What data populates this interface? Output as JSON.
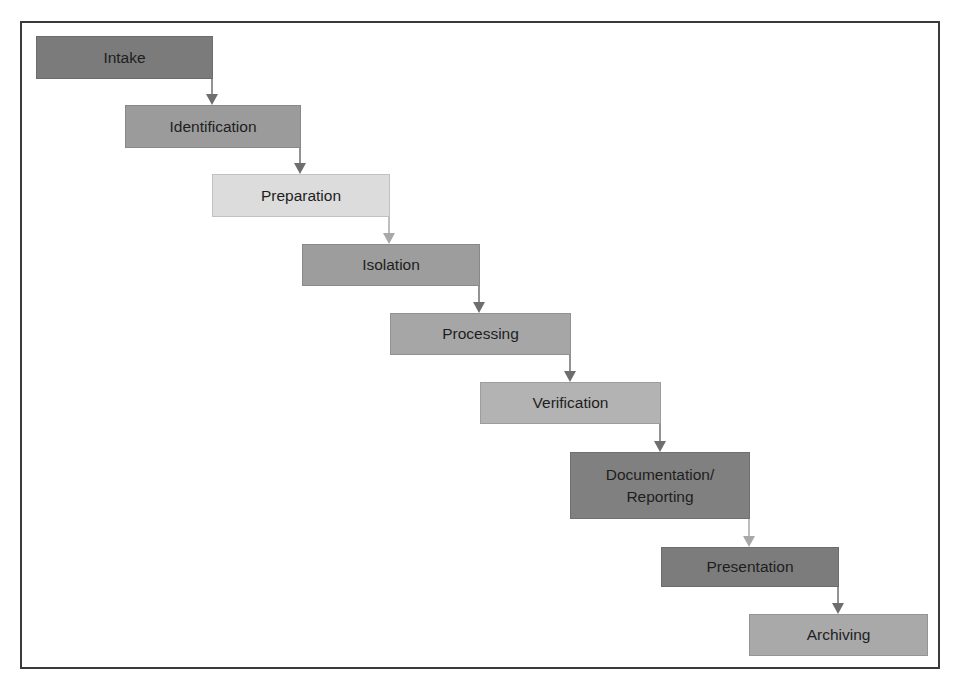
{
  "diagram": {
    "type": "waterfall-process-flow",
    "steps": [
      {
        "label": "Intake",
        "color": "#7b7b7b",
        "x": 36,
        "y": 36,
        "w": 177,
        "h": 43
      },
      {
        "label": "Identification",
        "color": "#9b9b9b",
        "x": 125,
        "y": 105,
        "w": 176,
        "h": 43
      },
      {
        "label": "Preparation",
        "color": "#dcdcdc",
        "x": 212,
        "y": 174,
        "w": 178,
        "h": 43
      },
      {
        "label": "Isolation",
        "color": "#9d9d9d",
        "x": 302,
        "y": 244,
        "w": 178,
        "h": 42
      },
      {
        "label": "Processing",
        "color": "#a6a6a6",
        "x": 390,
        "y": 313,
        "w": 181,
        "h": 42
      },
      {
        "label": "Verification",
        "color": "#b3b3b3",
        "x": 480,
        "y": 382,
        "w": 181,
        "h": 42
      },
      {
        "label": "Documentation/\nReporting",
        "color": "#808080",
        "x": 570,
        "y": 452,
        "w": 180,
        "h": 67
      },
      {
        "label": "Presentation",
        "color": "#7c7c7c",
        "x": 661,
        "y": 547,
        "w": 178,
        "h": 40
      },
      {
        "label": "Archiving",
        "color": "#a9a9a9",
        "x": 749,
        "y": 614,
        "w": 179,
        "h": 42
      }
    ],
    "connector_color": "#6e6e6e",
    "light_connector_color": "#a8a8a8"
  }
}
